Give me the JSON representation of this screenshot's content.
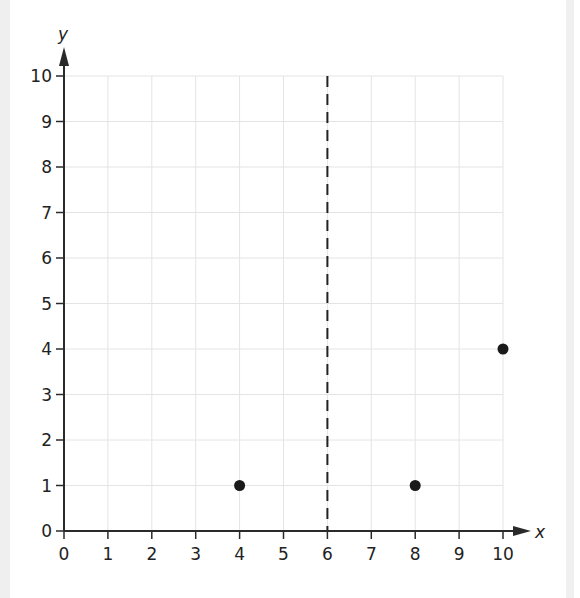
{
  "chart_data": {
    "type": "scatter",
    "title": "",
    "xlabel": "x",
    "ylabel": "y",
    "xlim": [
      0,
      10
    ],
    "ylim": [
      0,
      10
    ],
    "x_ticks": [
      "0",
      "1",
      "2",
      "3",
      "4",
      "5",
      "6",
      "7",
      "8",
      "9",
      "10"
    ],
    "y_ticks": [
      "0",
      "1",
      "2",
      "3",
      "4",
      "5",
      "6",
      "7",
      "8",
      "9",
      "10"
    ],
    "grid": true,
    "series": [
      {
        "name": "points",
        "points": [
          {
            "x": 4,
            "y": 1
          },
          {
            "x": 8,
            "y": 1
          },
          {
            "x": 10,
            "y": 4
          }
        ],
        "color": "#1a1a1a"
      }
    ],
    "annotations": [
      {
        "type": "vertical-dashed-line",
        "x": 6,
        "from_y": 0,
        "to_y": 10,
        "color": "#222222"
      }
    ]
  },
  "colors": {
    "axis": "#2a2a2a",
    "grid": "#e4e4e4",
    "point": "#1a1a1a"
  }
}
